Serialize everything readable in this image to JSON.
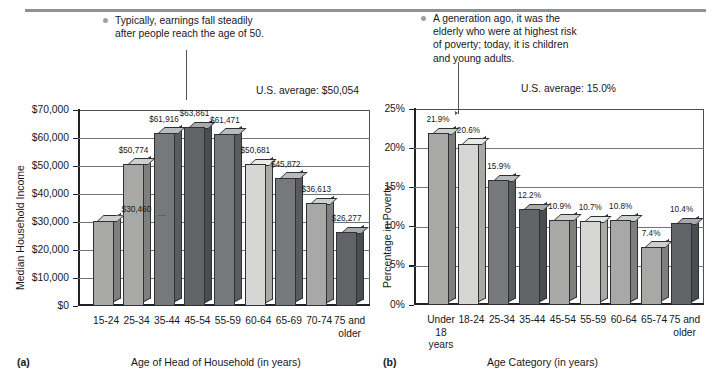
{
  "figure": {
    "top_rule": true,
    "panels": [
      {
        "letter": "(a)",
        "note": "Typically, earnings fall steadily\nafter people reach the age of 50.",
        "us_average": "U.S. average: $50,054"
      },
      {
        "letter": "(b)",
        "note": "A generation ago, it was the\nelderly who were at highest risk\nof poverty; today, it is children\nand young adults.",
        "us_average": "U.S. average: 15.0%"
      }
    ]
  },
  "chart_data": [
    {
      "type": "bar",
      "title": "",
      "xlabel": "Age of Head of Household (in years)",
      "ylabel": "Median Household Income",
      "ylim": [
        0,
        70000
      ],
      "ytick_labels": [
        "$70,000",
        "$60,000",
        "$50,000",
        "$40,000",
        "$30,000",
        "$20,000",
        "$10,000",
        "$0"
      ],
      "ytick_values": [
        70000,
        60000,
        50000,
        40000,
        30000,
        20000,
        10000,
        0
      ],
      "grid": true,
      "legend": "none",
      "categories": [
        "15-24",
        "25-34",
        "35-44",
        "45-54",
        "55-59",
        "60-64",
        "65-69",
        "70-74",
        "75 and\nolder"
      ],
      "values": [
        30460,
        50774,
        61916,
        63861,
        61471,
        50681,
        45872,
        36613,
        26277
      ],
      "data_labels": [
        "$30,460",
        "$50,774",
        "$61,916",
        "$63,861",
        "$61,471",
        "$50,681",
        "$45,872",
        "$36,613",
        "$26,277"
      ],
      "shades": [
        "med",
        "med",
        "dark",
        "xdark",
        "dark",
        "light",
        "dark",
        "med",
        "xdark"
      ],
      "annotation": "U.S. average: $50,054"
    },
    {
      "type": "bar",
      "title": "",
      "xlabel": "Age Category (in years)",
      "ylabel": "Percentage in Poverty",
      "ylim": [
        0,
        25
      ],
      "ytick_labels": [
        "25%",
        "20%",
        "15%",
        "10%",
        "5%",
        "0%"
      ],
      "ytick_values": [
        25,
        20,
        15,
        10,
        5,
        0
      ],
      "grid": true,
      "legend": "none",
      "categories": [
        "Under\n18\nyears",
        "18-24",
        "25-34",
        "35-44",
        "45-54",
        "55-59",
        "60-64",
        "65-74",
        "75 and\nolder"
      ],
      "values": [
        21.9,
        20.6,
        15.9,
        12.2,
        10.9,
        10.7,
        10.8,
        7.4,
        10.4
      ],
      "data_labels": [
        "21.9%",
        "20.6%",
        "15.9%",
        "12.2%",
        "10.9%",
        "10.7%",
        "10.8%",
        "7.4%",
        "10.4%"
      ],
      "shades": [
        "med",
        "light",
        "dark",
        "xdark",
        "med",
        "light",
        "med",
        "med",
        "xdark"
      ],
      "annotation": "U.S. average: 15.0%"
    }
  ],
  "colors": {
    "rule": "#8d9198",
    "axis": "#1f2226",
    "grid": "#6f757c",
    "text": "#17181a",
    "bullet": "#9aa0a6"
  }
}
